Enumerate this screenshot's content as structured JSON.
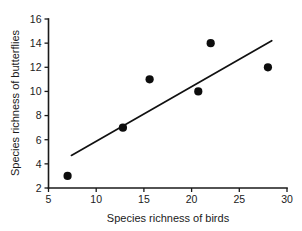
{
  "chart_data": {
    "type": "scatter",
    "title": "",
    "xlabel": "Species richness of birds",
    "ylabel": "Species richness of butterflies",
    "xlim": [
      5,
      30
    ],
    "ylim": [
      2,
      16
    ],
    "xticks": [
      5,
      10,
      15,
      20,
      25,
      30
    ],
    "yticks": [
      2,
      4,
      6,
      8,
      10,
      12,
      14,
      16
    ],
    "xtick_labels": [
      "5",
      "10",
      "15",
      "20",
      "25",
      "30"
    ],
    "ytick_labels": [
      "2",
      "4",
      "6",
      "8",
      "10",
      "12",
      "14",
      "16"
    ],
    "grid": false,
    "legend": false,
    "marker": "filled-circle",
    "marker_color": "#0d0d0d",
    "line_color": "#111111",
    "points": [
      {
        "x": 7.0,
        "y": 3.0
      },
      {
        "x": 12.8,
        "y": 7.0
      },
      {
        "x": 15.6,
        "y": 11.0
      },
      {
        "x": 20.7,
        "y": 10.0
      },
      {
        "x": 22.0,
        "y": 14.0
      },
      {
        "x": 28.0,
        "y": 12.0
      }
    ],
    "trendline": {
      "x_start": 7.4,
      "y_start": 4.7,
      "x_end": 28.4,
      "y_end": 14.2
    }
  },
  "axes": {
    "x_title": "Species richness of birds",
    "y_title": "Species richness of butterflies"
  }
}
